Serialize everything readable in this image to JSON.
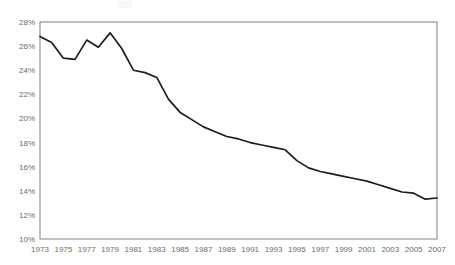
{
  "chart_data": {
    "type": "line",
    "title": "",
    "xlabel": "",
    "ylabel": "",
    "xlim": [
      1973,
      2007
    ],
    "ylim": [
      10,
      28
    ],
    "grid": false,
    "legend": null,
    "y_tick_labels": [
      "28%",
      "26%",
      "24%",
      "22%",
      "20%",
      "18%",
      "16%",
      "14%",
      "12%",
      "10%"
    ],
    "y_tick_values": [
      28,
      26,
      24,
      22,
      20,
      18,
      16,
      14,
      12,
      10
    ],
    "x_tick_labels": [
      "1973",
      "1975",
      "1977",
      "1979",
      "1981",
      "1983",
      "1985",
      "1987",
      "1989",
      "1991",
      "1993",
      "1995",
      "1997",
      "1999",
      "2001",
      "2003",
      "2005",
      "2007"
    ],
    "x_tick_values": [
      1973,
      1975,
      1977,
      1979,
      1981,
      1983,
      1985,
      1987,
      1989,
      1991,
      1993,
      1995,
      1997,
      1999,
      2001,
      2003,
      2005,
      2007
    ],
    "x": [
      1973,
      1974,
      1975,
      1976,
      1977,
      1978,
      1979,
      1980,
      1981,
      1982,
      1983,
      1984,
      1985,
      1986,
      1987,
      1988,
      1989,
      1990,
      1991,
      1992,
      1993,
      1994,
      1995,
      1996,
      1997,
      1998,
      1999,
      2000,
      2001,
      2002,
      2003,
      2004,
      2005,
      2006,
      2007
    ],
    "values": [
      26.8,
      26.3,
      25.0,
      24.9,
      26.5,
      25.9,
      27.1,
      25.8,
      24.0,
      23.8,
      23.4,
      21.6,
      20.5,
      19.9,
      19.3,
      18.9,
      18.5,
      18.3,
      18.0,
      17.8,
      17.6,
      17.4,
      16.5,
      15.9,
      15.6,
      15.4,
      15.2,
      15.0,
      14.8,
      14.5,
      14.2,
      13.9,
      13.8,
      13.3,
      13.4
    ],
    "series_name": "",
    "line_color": "#1d1d1d",
    "axis_label_color": "#6a6a6a",
    "frame_color": "#8c8c8c"
  },
  "plot": {
    "left_px": 40,
    "right_px": 437,
    "top_px": 22,
    "bottom_px": 239
  }
}
